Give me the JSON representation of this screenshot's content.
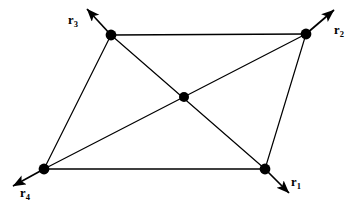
{
  "figure": {
    "type": "vector-lattice-diagram",
    "canvas": {
      "width": 363,
      "height": 209
    },
    "colors": {
      "background": "#ffffff",
      "stroke": "#000000",
      "node_fill": "#000000"
    },
    "style": {
      "edge_width": 1.3,
      "arrow_width": 1.6,
      "node_radius": 5.2,
      "center_node_radius": 5.0
    }
  },
  "nodes": [
    {
      "id": "n3",
      "name": "corner-top-left",
      "x": 111,
      "y": 35,
      "r": 5.4
    },
    {
      "id": "n2",
      "name": "corner-top-right",
      "x": 306,
      "y": 34,
      "r": 5.4
    },
    {
      "id": "n4",
      "name": "corner-bottom-left",
      "x": 44,
      "y": 169,
      "r": 5.4
    },
    {
      "id": "n1",
      "name": "corner-bottom-right",
      "x": 265,
      "y": 169,
      "r": 5.4
    },
    {
      "id": "nc",
      "name": "center-site",
      "x": 184,
      "y": 97,
      "r": 5.0
    }
  ],
  "edges": [
    {
      "name": "edge-top",
      "from": "n3",
      "to": "n2",
      "x1": 111,
      "y1": 35,
      "x2": 306,
      "y2": 34
    },
    {
      "name": "edge-bottom",
      "from": "n4",
      "to": "n1",
      "x1": 44,
      "y1": 169,
      "x2": 265,
      "y2": 169
    },
    {
      "name": "edge-left",
      "from": "n3",
      "to": "n4",
      "x1": 111,
      "y1": 35,
      "x2": 44,
      "y2": 169
    },
    {
      "name": "edge-right",
      "from": "n2",
      "to": "n1",
      "x1": 306,
      "y1": 34,
      "x2": 265,
      "y2": 169
    },
    {
      "name": "diagonal-topleft-bottomright",
      "from": "n3",
      "to": "n1",
      "x1": 111,
      "y1": 35,
      "x2": 265,
      "y2": 169
    },
    {
      "name": "diagonal-bottomleft-topright",
      "from": "n4",
      "to": "n2",
      "x1": 44,
      "y1": 169,
      "x2": 306,
      "y2": 34
    }
  ],
  "vectors": [
    {
      "id": "r1",
      "name": "vector-r1",
      "base": "r",
      "subscript": "1",
      "origin": {
        "x": 265,
        "y": 169
      },
      "tip": {
        "x": 289,
        "y": 193
      },
      "direction": "down-right",
      "label_position": {
        "left": 291,
        "top": 176
      }
    },
    {
      "id": "r2",
      "name": "vector-r2",
      "base": "r",
      "subscript": "2",
      "origin": {
        "x": 306,
        "y": 34
      },
      "tip": {
        "x": 334,
        "y": 10
      },
      "direction": "up-right",
      "label_position": {
        "left": 334,
        "top": 24
      }
    },
    {
      "id": "r3",
      "name": "vector-r3",
      "base": "r",
      "subscript": "3",
      "origin": {
        "x": 111,
        "y": 35
      },
      "tip": {
        "x": 87,
        "y": 9
      },
      "direction": "up-left",
      "label_position": {
        "left": 68,
        "top": 14
      }
    },
    {
      "id": "r4",
      "name": "vector-r4",
      "base": "r",
      "subscript": "4",
      "origin": {
        "x": 44,
        "y": 169
      },
      "tip": {
        "x": 13,
        "y": 186
      },
      "direction": "down-left",
      "label_position": {
        "left": 20,
        "top": 187
      }
    }
  ]
}
